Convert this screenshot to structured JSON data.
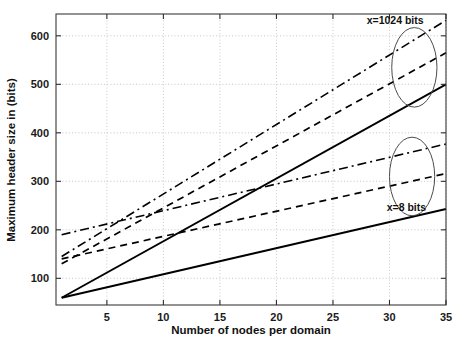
{
  "chart_data": {
    "type": "line",
    "title": "",
    "xlabel": "Number of nodes per domain",
    "ylabel": "Maximum header size in (bits)",
    "xlim": [
      0.5,
      35
    ],
    "ylim": [
      45,
      645
    ],
    "xticks": [
      5,
      10,
      15,
      20,
      25,
      30,
      35
    ],
    "yticks": [
      100,
      200,
      300,
      400,
      500,
      600
    ],
    "grid": true,
    "legend": "none",
    "annotations": [
      {
        "text": "x=1024 bits",
        "x": 30.5,
        "y": 625
      },
      {
        "text": "x=8 bits",
        "x": 31.5,
        "y": 238
      }
    ],
    "markers": [
      {
        "type": "ellipse",
        "label": "upper-group-highlight",
        "cx": 32.2,
        "cy": 535,
        "rx": 2.0,
        "ry": 82
      },
      {
        "type": "ellipse",
        "label": "lower-group-highlight",
        "cx": 32.0,
        "cy": 310,
        "rx": 2.0,
        "ry": 81
      }
    ],
    "x": [
      1,
      35
    ],
    "series": [
      {
        "name": "x=1024 bits, dash-dot",
        "style": "dashdot",
        "group": "x=1024 bits",
        "values": [
          145,
          632
        ]
      },
      {
        "name": "x=1024 bits, dashed",
        "style": "dashed",
        "group": "x=1024 bits",
        "values": [
          130,
          565
        ]
      },
      {
        "name": "x=1024 bits, solid",
        "style": "solid",
        "group": "x=1024 bits",
        "values": [
          60,
          500
        ]
      },
      {
        "name": "x=8 bits, dash-dot",
        "style": "dashdot",
        "group": "x=8 bits",
        "values": [
          190,
          377
        ]
      },
      {
        "name": "x=8 bits, dashed",
        "style": "dashed",
        "group": "x=8 bits",
        "values": [
          140,
          316
        ]
      },
      {
        "name": "x=8 bits, solid",
        "style": "solid",
        "group": "x=8 bits",
        "values": [
          60,
          243
        ]
      }
    ]
  },
  "figure": {
    "background_color": "#ffffff",
    "line_color": "#000000",
    "grid_color": "#b9b9b9",
    "axis_color": "#3a3a3a"
  }
}
